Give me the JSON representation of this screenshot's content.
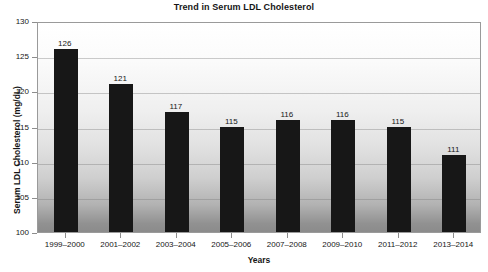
{
  "chart_data": {
    "type": "bar",
    "title": "Trend in Serum LDL Cholesterol",
    "xlabel": "Years",
    "ylabel": "Serum LDL Cholesterol (mg/dL)",
    "categories": [
      "1999–2000",
      "2001–2002",
      "2003–2004",
      "2005–2006",
      "2007–2008",
      "2009–2010",
      "2011–2012",
      "2013–2014"
    ],
    "values": [
      126,
      121,
      117,
      115,
      116,
      116,
      115,
      111
    ],
    "ylim": [
      100,
      130
    ],
    "yticks": [
      100,
      105,
      110,
      115,
      120,
      125,
      130
    ],
    "ytick_labels": [
      "100",
      "105",
      "110",
      "115",
      "120",
      "125",
      "130"
    ],
    "value_labels": [
      "126",
      "121",
      "117",
      "115",
      "116",
      "116",
      "115",
      "111"
    ],
    "grid": true,
    "legend": null,
    "bar_color": "#171717",
    "plot_background_top": "#ffffff",
    "plot_background_bottom": "#8b8b8b",
    "axis_color": "#9a9a9a",
    "text_color": "#161616"
  }
}
